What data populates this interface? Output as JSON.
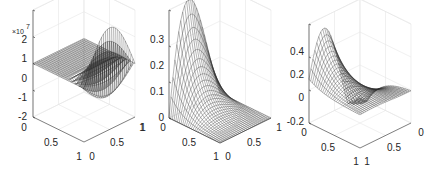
{
  "chart_data": [
    {
      "type": "surface-mesh",
      "title": "",
      "description": "3D wireframe mesh; flat near zero except a high-frequency oscillating band near x=1",
      "x_ticks": [
        "0",
        "0.5",
        "1"
      ],
      "y_ticks": [
        "0",
        "0.5",
        "1"
      ],
      "z_ticks": [
        "-2",
        "-1",
        "0",
        "1",
        "2"
      ],
      "z_multiplier_label": "×10",
      "z_multiplier_exponent": "7",
      "xlim": [
        0,
        1
      ],
      "ylim": [
        0,
        1
      ],
      "zlim": [
        -20000000.0,
        20000000.0
      ],
      "z_tick_values": [
        -20000000.0,
        -10000000.0,
        0,
        10000000.0,
        20000000.0
      ],
      "surface": "oscillating",
      "grid": true,
      "x_axis_order": "0 at left corner, 1 at front corner",
      "y_axis_order": "0 at front corner, 1 at right corner"
    },
    {
      "type": "surface-mesh",
      "title": "",
      "description": "3D wireframe mesh; peak ~0.3 near x=0 decaying to 0 along x",
      "x_ticks": [
        "1",
        "0"
      ],
      "x_tick_note": "left plot edge shows '1' beside the 0 tick of previous axis",
      "y_ticks": [
        "0",
        "0.5",
        "1"
      ],
      "y_ticks_right": [
        "0",
        "0.5",
        "1"
      ],
      "z_ticks": [
        "0",
        "0.1",
        "0.2",
        "0.3"
      ],
      "xlim": [
        0,
        1
      ],
      "ylim": [
        0,
        1
      ],
      "zlim": [
        0,
        0.3
      ],
      "z_tick_values": [
        0,
        0.1,
        0.2,
        0.3
      ],
      "surface": "peak",
      "grid": true
    },
    {
      "type": "surface-mesh",
      "title": "",
      "description": "3D wireframe mesh; sinusoidal ridge near x=0 dipping to about -0.2, decaying along x",
      "x_ticks": [
        "0",
        "0.5",
        "1"
      ],
      "y_ticks": [
        "1",
        "0.5",
        "0"
      ],
      "z_ticks": [
        "-0.2",
        "0",
        "0.2",
        "0.4"
      ],
      "xlim": [
        0,
        1
      ],
      "ylim": [
        0,
        1
      ],
      "zlim": [
        -0.2,
        0.4
      ],
      "z_tick_values": [
        -0.2,
        0,
        0.2,
        0.4
      ],
      "surface": "wave",
      "grid": true
    }
  ],
  "labels": {
    "p1": {
      "z": [
        "2",
        "1",
        "0",
        "-1",
        "-2"
      ],
      "mult": "×10",
      "exp": "7",
      "left": [
        "0",
        "0.5",
        "1"
      ],
      "right": [
        "0",
        "0.5",
        "1"
      ]
    },
    "p2": {
      "z": [
        "0.3",
        "0.2",
        "0.1",
        "0"
      ],
      "stray": "1",
      "left": [
        "0",
        "0.5",
        "1"
      ],
      "right": [
        "0",
        "0.5",
        "1"
      ]
    },
    "p3": {
      "z": [
        "0.4",
        "0.2",
        "0",
        "-0.2"
      ],
      "left": [
        "0",
        "0.5",
        "1"
      ],
      "right": [
        "1",
        "0.5",
        "0"
      ]
    }
  }
}
